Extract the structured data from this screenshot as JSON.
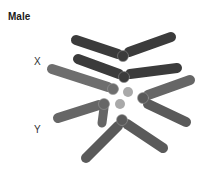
{
  "figure": {
    "title": "Male",
    "labels": {
      "x": "X",
      "y": "Y"
    }
  },
  "colors": {
    "dark": "#3b3b3b",
    "medium": "#6e6e6e",
    "light": "#a9a9a9",
    "background": "#ffffff"
  }
}
